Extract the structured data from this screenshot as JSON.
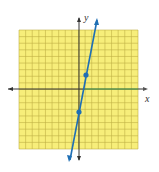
{
  "chart_data": {
    "type": "line",
    "title": "",
    "xlabel": "x",
    "ylabel": "y",
    "xlim": [
      -9,
      9
    ],
    "ylim": [
      -9,
      9
    ],
    "grid": true,
    "series": [
      {
        "name": "line",
        "x": [
          0,
          1
        ],
        "y": [
          -3,
          2
        ],
        "color": "#1f6fb5"
      }
    ],
    "points": [
      {
        "x": 1,
        "y": 2
      },
      {
        "x": 0,
        "y": -3
      }
    ],
    "colors": {
      "grid_fill": "#f7ee7a",
      "grid_line": "#b8a93a",
      "line": "#1f6fb5",
      "axis": "#333333"
    }
  },
  "labels": {
    "x": "x",
    "y": "y"
  }
}
